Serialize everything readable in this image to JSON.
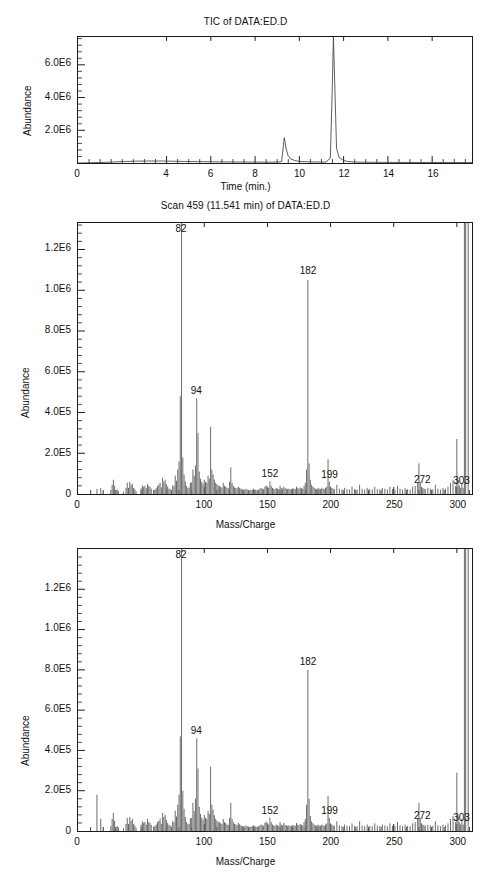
{
  "figures": [
    {
      "id": "tic",
      "title": "TIC of DATA:ED.D",
      "ylabel": "Abundance",
      "xlabel": "Time (min.)"
    },
    {
      "id": "scan",
      "title": "Scan 459 (11.541 min) of DATA:ED.D",
      "ylabel": "Abundance",
      "xlabel": "Mass/Charge"
    },
    {
      "id": "lib",
      "title": "",
      "ylabel": "Abundance",
      "xlabel": "Mass/Charge"
    }
  ],
  "chart_data": [
    {
      "type": "line",
      "id": "tic",
      "title": "TIC of DATA:ED.D",
      "xlabel": "Time (min.)",
      "ylabel": "Abundance",
      "xlim": [
        0,
        17.8
      ],
      "ylim": [
        0,
        7700000
      ],
      "grid": false,
      "legend": "none",
      "xticks": [
        0,
        4,
        6,
        8,
        10,
        12,
        14,
        16
      ],
      "xtick_labels": [
        "0",
        "4",
        "6",
        "8",
        "10",
        "12",
        "14",
        "16"
      ],
      "x_minor_step": 0.5,
      "yticks": [
        2000000,
        4000000,
        6000000
      ],
      "ytick_labels": [
        "2.0E6",
        "4.0E6",
        "6.0E6"
      ],
      "y_minor_step": 400000,
      "x": [
        0.0,
        1.0,
        1.6,
        2.0,
        2.6,
        3.2,
        3.8,
        4.2,
        4.8,
        5.4,
        6.0,
        6.6,
        7.2,
        7.8,
        8.4,
        9.0,
        9.2,
        9.32,
        9.4,
        9.48,
        9.6,
        9.8,
        10.0,
        10.4,
        10.8,
        11.2,
        11.4,
        11.48,
        11.54,
        11.6,
        11.68,
        11.8,
        12.0,
        12.2,
        12.5,
        13.0,
        14.0,
        15.0,
        16.0,
        17.0,
        17.8
      ],
      "y": [
        0,
        30000,
        60000,
        90000,
        110000,
        120000,
        120000,
        110000,
        95000,
        85000,
        75000,
        70000,
        62000,
        58000,
        52000,
        55000,
        90000,
        1550000,
        900000,
        480000,
        260000,
        150000,
        95000,
        70000,
        60000,
        60000,
        300000,
        4200000,
        7700000,
        4800000,
        900000,
        330000,
        150000,
        90000,
        60000,
        45000,
        38000,
        34000,
        30000,
        28000,
        26000
      ],
      "peaks_described": [
        {
          "retention_time": 9.32,
          "abundance": 1550000
        },
        {
          "retention_time": 11.541,
          "abundance": 7700000
        }
      ]
    },
    {
      "type": "bar",
      "id": "scan",
      "title": "Scan 459 (11.541 min) of DATA:ED.D",
      "xlabel": "Mass/Charge",
      "ylabel": "Abundance",
      "xlim": [
        0,
        312
      ],
      "ylim": [
        0,
        1330000
      ],
      "grid": false,
      "legend": "none",
      "xticks": [
        0,
        100,
        150,
        200,
        250,
        300
      ],
      "xtick_labels": [
        "0",
        "100",
        "150",
        "200",
        "250",
        "300"
      ],
      "x_minor_step": 10,
      "yticks": [
        200000,
        400000,
        600000,
        800000,
        1000000,
        1200000
      ],
      "ytick_labels": [
        "2.0E5",
        "4.0E5",
        "6.0E5",
        "8.0E5",
        "1.0E6",
        "1.2E6"
      ],
      "y_minor_step": 40000,
      "annotations": [
        {
          "mz": 82,
          "text": "82"
        },
        {
          "mz": 94,
          "text": "94"
        },
        {
          "mz": 152,
          "text": "152"
        },
        {
          "mz": 182,
          "text": "182"
        },
        {
          "mz": 199,
          "text": "199"
        },
        {
          "mz": 272,
          "text": "272"
        },
        {
          "mz": 303,
          "text": "303"
        }
      ],
      "mz": [
        15,
        18,
        20,
        26,
        27,
        28,
        29,
        30,
        31,
        32,
        36,
        38,
        39,
        40,
        41,
        42,
        43,
        44,
        45,
        46,
        50,
        51,
        52,
        53,
        54,
        55,
        56,
        57,
        58,
        60,
        61,
        62,
        63,
        64,
        65,
        66,
        67,
        68,
        69,
        70,
        71,
        72,
        73,
        74,
        75,
        76,
        77,
        78,
        79,
        80,
        81,
        82,
        83,
        84,
        85,
        86,
        87,
        88,
        89,
        90,
        91,
        92,
        93,
        94,
        95,
        96,
        97,
        98,
        99,
        100,
        101,
        102,
        103,
        104,
        105,
        106,
        107,
        108,
        109,
        110,
        111,
        112,
        113,
        114,
        115,
        116,
        117,
        118,
        119,
        120,
        121,
        122,
        123,
        124,
        125,
        126,
        127,
        128,
        129,
        130,
        131,
        132,
        133,
        134,
        135,
        136,
        137,
        138,
        139,
        140,
        141,
        142,
        143,
        144,
        145,
        146,
        147,
        148,
        149,
        150,
        151,
        152,
        153,
        154,
        155,
        156,
        157,
        158,
        159,
        160,
        161,
        162,
        163,
        164,
        165,
        166,
        167,
        168,
        169,
        170,
        171,
        172,
        173,
        174,
        175,
        176,
        177,
        178,
        179,
        180,
        181,
        182,
        183,
        184,
        185,
        186,
        187,
        188,
        189,
        190,
        191,
        192,
        193,
        194,
        195,
        196,
        197,
        198,
        199,
        200,
        201,
        202,
        203,
        205,
        207,
        209,
        211,
        213,
        215,
        217,
        219,
        221,
        223,
        225,
        227,
        229,
        231,
        233,
        235,
        237,
        239,
        241,
        243,
        245,
        247,
        249,
        251,
        253,
        255,
        257,
        259,
        261,
        263,
        265,
        267,
        269,
        270,
        271,
        272,
        273,
        274,
        275,
        277,
        279,
        281,
        283,
        285,
        287,
        289,
        291,
        293,
        295,
        297,
        299,
        300,
        301,
        302,
        303,
        304,
        305,
        306,
        307,
        309
      ],
      "intensity": [
        25000,
        30000,
        15000,
        20000,
        45000,
        70000,
        40000,
        18000,
        22000,
        15000,
        12000,
        30000,
        55000,
        30000,
        60000,
        45000,
        50000,
        30000,
        25000,
        14000,
        28000,
        42000,
        35000,
        40000,
        28000,
        50000,
        40000,
        35000,
        26000,
        20000,
        22000,
        28000,
        40000,
        45000,
        55000,
        32000,
        80000,
        60000,
        70000,
        48000,
        36000,
        26000,
        24000,
        20000,
        42000,
        40000,
        90000,
        65000,
        120000,
        160000,
        480000,
        1330000,
        180000,
        95000,
        62000,
        40000,
        30000,
        32000,
        55000,
        58000,
        120000,
        90000,
        140000,
        470000,
        300000,
        110000,
        75000,
        60000,
        50000,
        70000,
        60000,
        55000,
        90000,
        75000,
        330000,
        120000,
        95000,
        70000,
        55000,
        48000,
        42000,
        40000,
        35000,
        32000,
        55000,
        40000,
        36000,
        30000,
        28000,
        60000,
        130000,
        55000,
        40000,
        32000,
        30000,
        28000,
        36000,
        30000,
        26000,
        24000,
        22000,
        20000,
        26000,
        22000,
        20000,
        18000,
        20000,
        22000,
        26000,
        22000,
        20000,
        18000,
        22000,
        26000,
        30000,
        26000,
        24000,
        36000,
        42000,
        36000,
        30000,
        62000,
        40000,
        30000,
        26000,
        24000,
        30000,
        26000,
        24000,
        40000,
        30000,
        26000,
        36000,
        28000,
        26000,
        24000,
        26000,
        22000,
        24000,
        28000,
        26000,
        24000,
        36000,
        30000,
        26000,
        32000,
        28000,
        26000,
        40000,
        55000,
        120000,
        1050000,
        150000,
        70000,
        45000,
        36000,
        30000,
        26000,
        24000,
        30000,
        26000,
        24000,
        30000,
        26000,
        24000,
        30000,
        36000,
        170000,
        60000,
        36000,
        30000,
        26000,
        24000,
        45000,
        26000,
        22000,
        30000,
        24000,
        22000,
        36000,
        24000,
        22000,
        45000,
        26000,
        22000,
        30000,
        24000,
        22000,
        36000,
        24000,
        22000,
        30000,
        26000,
        22000,
        36000,
        24000,
        22000,
        40000,
        26000,
        22000,
        30000,
        24000,
        22000,
        36000,
        40000,
        55000,
        150000,
        60000,
        36000,
        30000,
        26000,
        24000,
        30000,
        26000,
        24000,
        45000,
        26000,
        22000,
        30000,
        26000,
        36000,
        55000,
        70000,
        40000,
        270000,
        70000,
        40000,
        30000,
        55000,
        30000
      ]
    },
    {
      "type": "bar",
      "id": "lib",
      "title": "",
      "xlabel": "Mass/Charge",
      "ylabel": "Abundance",
      "xlim": [
        0,
        312
      ],
      "ylim": [
        0,
        1400000
      ],
      "grid": false,
      "legend": "none",
      "xticks": [
        0,
        100,
        150,
        200,
        250,
        300
      ],
      "xtick_labels": [
        "0",
        "100",
        "150",
        "200",
        "250",
        "300"
      ],
      "x_minor_step": 10,
      "yticks": [
        200000,
        400000,
        600000,
        800000,
        1000000,
        1200000
      ],
      "ytick_labels": [
        "2.0E5",
        "4.0E5",
        "6.0E5",
        "8.0E5",
        "1.0E6",
        "1.2E6"
      ],
      "y_minor_step": 40000,
      "annotations": [
        {
          "mz": 82,
          "text": "82"
        },
        {
          "mz": 94,
          "text": "94"
        },
        {
          "mz": 152,
          "text": "152"
        },
        {
          "mz": 182,
          "text": "182"
        },
        {
          "mz": 199,
          "text": "199"
        },
        {
          "mz": 272,
          "text": "272"
        },
        {
          "mz": 303,
          "text": "303"
        }
      ],
      "mz": [
        15,
        18,
        20,
        26,
        27,
        28,
        29,
        30,
        31,
        32,
        36,
        38,
        39,
        40,
        41,
        42,
        43,
        44,
        45,
        46,
        50,
        51,
        52,
        53,
        54,
        55,
        56,
        57,
        58,
        60,
        61,
        62,
        63,
        64,
        65,
        66,
        67,
        68,
        69,
        70,
        71,
        72,
        73,
        74,
        75,
        76,
        77,
        78,
        79,
        80,
        81,
        82,
        83,
        84,
        85,
        86,
        87,
        88,
        89,
        90,
        91,
        92,
        93,
        94,
        95,
        96,
        97,
        98,
        99,
        100,
        101,
        102,
        103,
        104,
        105,
        106,
        107,
        108,
        109,
        110,
        111,
        112,
        113,
        114,
        115,
        116,
        117,
        118,
        119,
        120,
        121,
        122,
        123,
        124,
        125,
        126,
        127,
        128,
        129,
        130,
        131,
        132,
        133,
        134,
        135,
        136,
        137,
        138,
        139,
        140,
        141,
        142,
        143,
        144,
        145,
        146,
        147,
        148,
        149,
        150,
        151,
        152,
        153,
        154,
        155,
        156,
        157,
        158,
        159,
        160,
        161,
        162,
        163,
        164,
        165,
        166,
        167,
        168,
        169,
        170,
        171,
        172,
        173,
        174,
        175,
        176,
        177,
        178,
        179,
        180,
        181,
        182,
        183,
        184,
        185,
        186,
        187,
        188,
        189,
        190,
        191,
        192,
        193,
        194,
        195,
        196,
        197,
        198,
        199,
        200,
        201,
        202,
        203,
        205,
        207,
        209,
        211,
        213,
        215,
        217,
        219,
        221,
        223,
        225,
        227,
        229,
        231,
        233,
        235,
        237,
        239,
        241,
        243,
        245,
        247,
        249,
        251,
        253,
        255,
        257,
        259,
        261,
        263,
        265,
        267,
        269,
        270,
        271,
        272,
        273,
        274,
        275,
        277,
        279,
        281,
        283,
        285,
        287,
        289,
        291,
        293,
        295,
        297,
        299,
        300,
        301,
        302,
        303,
        304,
        305,
        306,
        307,
        309
      ],
      "intensity": [
        180000,
        60000,
        20000,
        25000,
        60000,
        90000,
        50000,
        20000,
        25000,
        18000,
        14000,
        35000,
        65000,
        35000,
        70000,
        50000,
        60000,
        35000,
        28000,
        16000,
        32000,
        48000,
        40000,
        45000,
        32000,
        60000,
        45000,
        40000,
        30000,
        22000,
        25000,
        32000,
        45000,
        50000,
        62000,
        36000,
        90000,
        70000,
        80000,
        55000,
        40000,
        30000,
        28000,
        22000,
        48000,
        45000,
        100000,
        72000,
        130000,
        180000,
        470000,
        1400000,
        200000,
        110000,
        70000,
        45000,
        34000,
        36000,
        62000,
        65000,
        140000,
        100000,
        160000,
        460000,
        310000,
        120000,
        85000,
        66000,
        55000,
        80000,
        66000,
        60000,
        100000,
        85000,
        320000,
        130000,
        105000,
        78000,
        60000,
        52000,
        46000,
        44000,
        38000,
        35000,
        60000,
        44000,
        40000,
        33000,
        30000,
        65000,
        140000,
        60000,
        44000,
        35000,
        32000,
        30000,
        40000,
        33000,
        28000,
        26000,
        24000,
        22000,
        28000,
        24000,
        22000,
        20000,
        22000,
        24000,
        28000,
        24000,
        22000,
        20000,
        24000,
        28000,
        32000,
        28000,
        26000,
        40000,
        46000,
        40000,
        32000,
        66000,
        44000,
        32000,
        28000,
        26000,
        32000,
        28000,
        26000,
        44000,
        32000,
        28000,
        40000,
        30000,
        28000,
        26000,
        28000,
        24000,
        26000,
        30000,
        28000,
        26000,
        40000,
        32000,
        28000,
        35000,
        30000,
        28000,
        44000,
        60000,
        130000,
        800000,
        160000,
        75000,
        48000,
        38000,
        32000,
        28000,
        26000,
        32000,
        28000,
        26000,
        32000,
        28000,
        26000,
        32000,
        38000,
        175000,
        65000,
        38000,
        32000,
        28000,
        26000,
        48000,
        28000,
        24000,
        32000,
        26000,
        24000,
        38000,
        26000,
        24000,
        48000,
        28000,
        24000,
        32000,
        26000,
        24000,
        38000,
        26000,
        24000,
        32000,
        28000,
        24000,
        38000,
        26000,
        24000,
        44000,
        28000,
        24000,
        32000,
        26000,
        24000,
        38000,
        44000,
        60000,
        140000,
        65000,
        38000,
        32000,
        28000,
        26000,
        32000,
        28000,
        26000,
        48000,
        28000,
        24000,
        32000,
        28000,
        38000,
        60000,
        75000,
        44000,
        290000,
        75000,
        44000,
        32000,
        60000,
        32000
      ]
    }
  ]
}
